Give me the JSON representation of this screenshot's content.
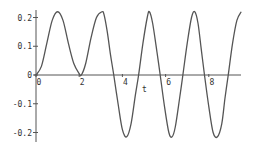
{
  "chart_data": {
    "type": "line",
    "title": "",
    "xlabel": "t",
    "ylabel": "",
    "xlim": [
      0,
      9.5
    ],
    "ylim": [
      -0.23,
      0.23
    ],
    "grid": false,
    "legend": null,
    "x_ticks": [
      0,
      2,
      4,
      6,
      8
    ],
    "x_tick_labels": [
      "0",
      "2",
      "4",
      "6",
      "8"
    ],
    "y_ticks": [
      0.2,
      0.1,
      0,
      -0.1,
      -0.2
    ],
    "y_tick_labels": [
      "0.2",
      "0.1",
      "0",
      "-0.1",
      "-0.2"
    ],
    "line_color": "#555555",
    "series": [
      {
        "name": "y(t)",
        "x": [
          0,
          0.25,
          0.5,
          0.75,
          1.0,
          1.25,
          1.5,
          1.75,
          2.0,
          2.1,
          2.3,
          2.55,
          2.8,
          3.05,
          3.15,
          3.3,
          3.45,
          3.6,
          3.8,
          4.0,
          4.2,
          4.4,
          4.6,
          4.75,
          4.95,
          5.15,
          5.25,
          5.4,
          5.6,
          5.75,
          5.95,
          6.15,
          6.3,
          6.45,
          6.65,
          6.8,
          7.0,
          7.2,
          7.35,
          7.5,
          7.65,
          7.8,
          8.0,
          8.2,
          8.4,
          8.6,
          8.75,
          8.9,
          9.1,
          9.3,
          9.5
        ],
        "y": [
          0,
          0.03,
          0.11,
          0.19,
          0.22,
          0.19,
          0.11,
          0.04,
          0.005,
          0,
          0.04,
          0.13,
          0.2,
          0.22,
          0.21,
          0.15,
          0.07,
          0,
          -0.1,
          -0.19,
          -0.215,
          -0.17,
          -0.07,
          0,
          0.11,
          0.2,
          0.22,
          0.18,
          0.08,
          0,
          -0.11,
          -0.2,
          -0.215,
          -0.18,
          -0.08,
          0,
          0.11,
          0.2,
          0.22,
          0.18,
          0.09,
          0,
          -0.11,
          -0.2,
          -0.215,
          -0.17,
          -0.08,
          0,
          0.11,
          0.19,
          0.22
        ]
      }
    ]
  },
  "axis_labels": {
    "x": "t"
  }
}
